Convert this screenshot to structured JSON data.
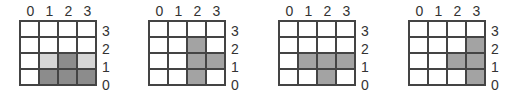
{
  "panels": [
    {
      "id": "grid-1",
      "col_labels": [
        "0",
        "1",
        "2",
        "3"
      ],
      "row_labels": [
        "3",
        "2",
        "1",
        "0"
      ],
      "cells": [
        [
          "none",
          "none",
          "none",
          "none"
        ],
        [
          "none",
          "none",
          "none",
          "none"
        ],
        [
          "none",
          "light",
          "dark",
          "light"
        ],
        [
          "none",
          "dark",
          "dark",
          "dark"
        ]
      ]
    },
    {
      "id": "grid-2",
      "col_labels": [
        "0",
        "1",
        "2",
        "3"
      ],
      "row_labels": [
        "3",
        "2",
        "1",
        "0"
      ],
      "cells": [
        [
          "none",
          "none",
          "none",
          "none"
        ],
        [
          "none",
          "none",
          "mid",
          "none"
        ],
        [
          "none",
          "none",
          "mid",
          "mid"
        ],
        [
          "none",
          "none",
          "mid",
          "none"
        ]
      ]
    },
    {
      "id": "grid-3",
      "col_labels": [
        "0",
        "1",
        "2",
        "3"
      ],
      "row_labels": [
        "3",
        "2",
        "1",
        "0"
      ],
      "cells": [
        [
          "none",
          "none",
          "none",
          "none"
        ],
        [
          "none",
          "none",
          "none",
          "none"
        ],
        [
          "none",
          "mid",
          "mid",
          "mid"
        ],
        [
          "none",
          "none",
          "mid",
          "none"
        ]
      ]
    },
    {
      "id": "grid-4",
      "col_labels": [
        "0",
        "1",
        "2",
        "3"
      ],
      "row_labels": [
        "3",
        "2",
        "1",
        "0"
      ],
      "cells": [
        [
          "none",
          "none",
          "none",
          "none"
        ],
        [
          "none",
          "none",
          "none",
          "mid"
        ],
        [
          "none",
          "none",
          "mid",
          "mid"
        ],
        [
          "none",
          "none",
          "none",
          "mid"
        ]
      ]
    }
  ],
  "shade_colors": {
    "none": "#ffffff",
    "light": "#d6d6d6",
    "dark": "#8c8c8c",
    "mid": "#a3a3a3"
  }
}
